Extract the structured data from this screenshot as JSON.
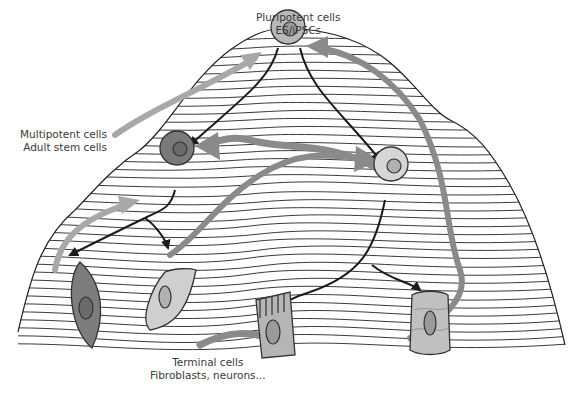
{
  "diagram": {
    "labels": {
      "pluripotent": {
        "line1": "Pluripotent cells",
        "line2": "ES/iPSCs"
      },
      "multipotent": {
        "line1": "Multipotent cells",
        "line2": "Adult stem cells"
      },
      "terminal": {
        "line1": "Terminal cells",
        "line2": "Fibroblasts, neurons..."
      }
    },
    "nodes": [
      {
        "id": "pluripotent-cell",
        "kind": "round-cell",
        "fill": "#b8b8b8",
        "nucleus": "#9a9a9a"
      },
      {
        "id": "multipotent-cell",
        "kind": "round-cell",
        "fill": "#7a7a7a",
        "nucleus": "#6a6a6a"
      },
      {
        "id": "intermediate-cell",
        "kind": "round-cell",
        "fill": "#d6d6d6",
        "nucleus": "#b0b0b0"
      },
      {
        "id": "fibroblast-cell",
        "kind": "spindle-cell",
        "fill": "#7d7d7d"
      },
      {
        "id": "epithelial-cell",
        "kind": "flat-cell",
        "fill": "#cfcfcf"
      },
      {
        "id": "ciliated-cell",
        "kind": "ciliated-cell",
        "fill": "#b5b5b5"
      },
      {
        "id": "muscle-cell",
        "kind": "cylinder-cell",
        "fill": "#c0c0c0"
      }
    ],
    "arrow_types": {
      "differentiation": {
        "color": "#1a1a1a",
        "meaning": "downhill differentiation"
      },
      "reprogramming": {
        "color": "#8a8a8a",
        "meaning": "dedifferentiation / reprogramming"
      },
      "light_reprogramming": {
        "color": "#a8a8a8",
        "meaning": "partial reprogramming"
      }
    },
    "colors": {
      "contour": "#3a3a3a",
      "outline": "#222222",
      "text": "#3a3a3a"
    }
  }
}
